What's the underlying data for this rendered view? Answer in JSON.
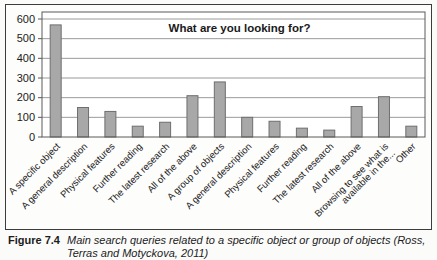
{
  "figure": {
    "caption": {
      "label": "Figure 7.4",
      "lines": [
        "Main search queries related to a specific object or group of objects (Ross,",
        "Terras and Motyckova, 2011)"
      ]
    }
  },
  "chart_data": {
    "type": "bar",
    "title": "What are you looking for?",
    "categories": [
      "A specific object",
      "A general description",
      "Physical features",
      "Further reading",
      "The latest research",
      "All of the above",
      "A group of objects",
      "A general description",
      "Physical features",
      "Further reading",
      "The latest research",
      "All of the above",
      "Browsing to see what is\navailable in the...",
      "Other"
    ],
    "values": [
      570,
      150,
      130,
      55,
      75,
      210,
      280,
      100,
      80,
      45,
      35,
      155,
      205,
      55
    ],
    "ylim": [
      0,
      600
    ],
    "ytick_step": 100,
    "grid": true,
    "legend": "none",
    "xlabel": "",
    "ylabel": "",
    "bar_color": "#a8a8a8",
    "bar_border_color": "#6e6e6e",
    "grid_color": "#8f8f8f",
    "axis_color": "#5a5a5a"
  }
}
